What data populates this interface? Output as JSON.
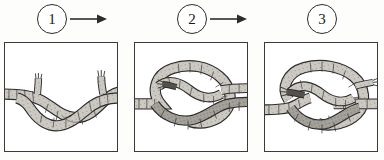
{
  "figure": {
    "kind": "instructional-sequence",
    "step_count": 3,
    "background_color": "#fdfdfc",
    "ink_color": "#2c2c2c",
    "rope_fill_color": "#c9c6c0",
    "rope_shadow_color": "#8d8a85"
  },
  "steps": [
    {
      "number": "1",
      "badge_name": "step-1-badge",
      "panel_name": "step-1-panel",
      "caption": "",
      "description": "Two rope ends crossed over one another lying almost flat",
      "has_arrow_after": true
    },
    {
      "number": "2",
      "badge_name": "step-2-badge",
      "panel_name": "step-2-panel",
      "caption": "",
      "description": "Ropes looped into an open interlocking knot loop",
      "has_arrow_after": true
    },
    {
      "number": "3",
      "badge_name": "step-3-badge",
      "panel_name": "step-3-panel",
      "caption": "",
      "description": "Knot drawn tighter with both working ends emerging",
      "has_arrow_after": false
    }
  ],
  "arrows": [
    {
      "name": "arrow-step-1-to-2",
      "direction": "right"
    },
    {
      "name": "arrow-step-2-to-3",
      "direction": "right"
    }
  ]
}
